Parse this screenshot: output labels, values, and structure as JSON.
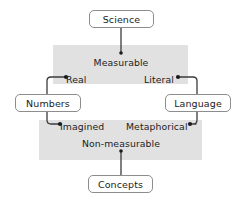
{
  "diagram": {
    "type": "concept-map",
    "title": "",
    "background_color": "#ffffff",
    "band_color": "#e1e1e1",
    "line_color": "#3b3b3b",
    "box_border_color": "#8d8d8d",
    "text_color": "#1c1c1c",
    "nodes": {
      "science": "Science",
      "numbers": "Numbers",
      "language": "Language",
      "concepts": "Concepts"
    },
    "bands": {
      "upper": {
        "heading": "Measurable",
        "left_label": "Real",
        "right_label": "Literal"
      },
      "lower": {
        "heading": "Non-measurable",
        "left_label": "Imagined",
        "right_label": "Metaphorical"
      }
    },
    "edges": [
      {
        "from": "Science",
        "to": "Measurable",
        "marker": "none"
      },
      {
        "from": "Real",
        "to": "Numbers",
        "marker": "dot-at-real"
      },
      {
        "from": "Literal",
        "to": "Language",
        "marker": "dot-at-literal"
      },
      {
        "from": "Numbers",
        "to": "Imagined",
        "marker": "dot-at-imagined"
      },
      {
        "from": "Language",
        "to": "Metaphorical",
        "marker": "dot-at-metaphorical"
      },
      {
        "from": "Non-measurable",
        "to": "Concepts",
        "marker": "dot-at-non-measurable"
      }
    ]
  }
}
